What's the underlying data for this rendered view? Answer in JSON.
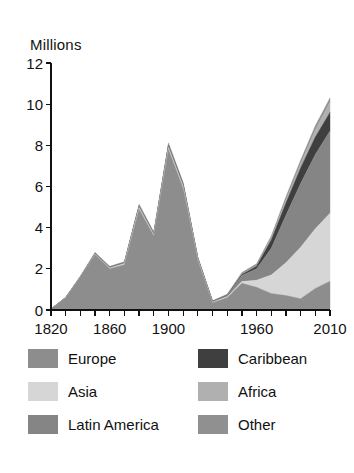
{
  "chart_data": {
    "type": "area",
    "stacked": true,
    "title": "",
    "ylabel": "Millions",
    "xlabel": "",
    "ylim": [
      0,
      12
    ],
    "xlim": [
      1820,
      2010
    ],
    "yticks": [
      "0",
      "2",
      "4",
      "6",
      "8",
      "10",
      "12"
    ],
    "ytick_values": [
      0,
      2,
      4,
      6,
      8,
      10,
      12
    ],
    "xticks_labeled": [
      "1820",
      "1860",
      "1900",
      "1960",
      "2010"
    ],
    "xtick_values": [
      1820,
      1830,
      1840,
      1850,
      1860,
      1870,
      1880,
      1890,
      1900,
      1910,
      1920,
      1930,
      1940,
      1950,
      1960,
      1970,
      1980,
      1990,
      2000,
      2010
    ],
    "grid": false,
    "legend_position": "bottom",
    "x": [
      1820,
      1830,
      1840,
      1850,
      1860,
      1870,
      1880,
      1890,
      1900,
      1910,
      1920,
      1930,
      1940,
      1950,
      1960,
      1970,
      1980,
      1990,
      2000,
      2010
    ],
    "series": [
      {
        "name": "Europe",
        "color": "#8d8d8d",
        "values": [
          0.05,
          0.6,
          1.6,
          2.7,
          2.0,
          2.2,
          4.9,
          3.6,
          7.8,
          5.9,
          2.4,
          0.35,
          0.6,
          1.3,
          1.1,
          0.8,
          0.7,
          0.55,
          1.05,
          1.4
        ]
      },
      {
        "name": "Asia",
        "color": "#d6d6d6",
        "values": [
          0.0,
          0.0,
          0.0,
          0.02,
          0.04,
          0.06,
          0.08,
          0.06,
          0.1,
          0.1,
          0.05,
          0.03,
          0.04,
          0.08,
          0.35,
          0.9,
          1.6,
          2.5,
          2.9,
          3.3
        ]
      },
      {
        "name": "Latin America",
        "color": "#858585",
        "values": [
          0.0,
          0.0,
          0.0,
          0.02,
          0.03,
          0.04,
          0.06,
          0.05,
          0.08,
          0.1,
          0.06,
          0.04,
          0.08,
          0.3,
          0.55,
          1.3,
          2.3,
          3.1,
          3.6,
          4.0
        ]
      },
      {
        "name": "Caribbean",
        "color": "#3f3f3f",
        "values": [
          0.0,
          0.0,
          0.0,
          0.0,
          0.0,
          0.0,
          0.0,
          0.0,
          0.0,
          0.0,
          0.0,
          0.0,
          0.0,
          0.05,
          0.12,
          0.4,
          0.6,
          0.75,
          0.85,
          0.9
        ]
      },
      {
        "name": "Africa",
        "color": "#b0b0b0",
        "values": [
          0.0,
          0.0,
          0.0,
          0.0,
          0.0,
          0.0,
          0.0,
          0.0,
          0.0,
          0.0,
          0.0,
          0.0,
          0.0,
          0.02,
          0.03,
          0.08,
          0.14,
          0.2,
          0.35,
          0.5
        ]
      },
      {
        "name": "Other",
        "color": "#909090",
        "values": [
          0.0,
          0.02,
          0.05,
          0.06,
          0.05,
          0.05,
          0.1,
          0.08,
          0.14,
          0.1,
          0.06,
          0.03,
          0.05,
          0.07,
          0.1,
          0.12,
          0.16,
          0.18,
          0.2,
          0.2
        ]
      }
    ]
  },
  "legend": {
    "left_column": [
      {
        "label": "Europe",
        "color": "#8d8d8d"
      },
      {
        "label": "Asia",
        "color": "#d6d6d6"
      },
      {
        "label": "Latin America",
        "color": "#858585"
      }
    ],
    "right_column": [
      {
        "label": "Caribbean",
        "color": "#3f3f3f"
      },
      {
        "label": "Africa",
        "color": "#b0b0b0"
      },
      {
        "label": "Other",
        "color": "#909090"
      }
    ]
  }
}
